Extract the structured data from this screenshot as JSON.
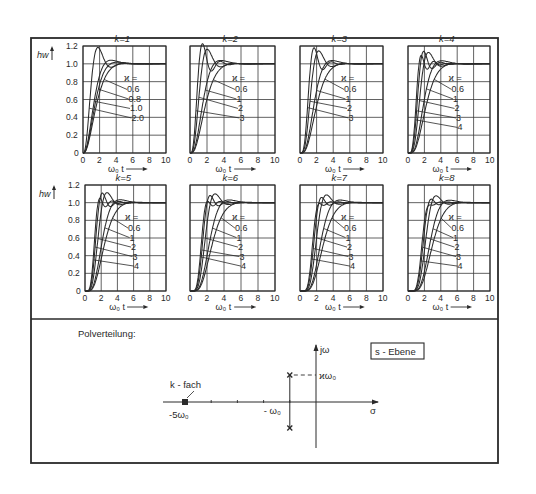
{
  "figure": {
    "frame": {
      "left": 31,
      "top": 38,
      "right": 498,
      "bottom": 463,
      "divider_y": 319
    },
    "colors": {
      "ink": "#2a2a2a",
      "grid": "#3a3a3a",
      "background": "#ffffff"
    },
    "y_axis_label": "h_W",
    "x_axis_label": "ω₀ t",
    "kappa_header": "ϰ ="
  },
  "chart_data": [
    {
      "type": "line",
      "title": "k = 1",
      "k": 1,
      "xlabel": "ω₀ t",
      "ylabel": "h_W",
      "xlim": [
        0,
        10
      ],
      "ylim": [
        0,
        1.2
      ],
      "xticks": [
        "0",
        "2",
        "4",
        "6",
        "8",
        "10"
      ],
      "yticks": [
        "0",
        "0.2",
        "0.4",
        "0.6",
        "0.8",
        "1.0",
        "1.2"
      ],
      "legend_title": "ϰ =",
      "series": [
        {
          "name": "0.6",
          "kappa": 0.6
        },
        {
          "name": "0.8",
          "kappa": 0.8
        },
        {
          "name": "1.0",
          "kappa": 1.0
        },
        {
          "name": "2.0",
          "kappa": 2.0
        }
      ],
      "box": {
        "x0": 83,
        "x1": 166,
        "y0": 46,
        "y1": 153
      },
      "show_yticks": true
    },
    {
      "type": "line",
      "title": "k = 2",
      "k": 2,
      "xlabel": "ω₀ t",
      "ylabel": "h_W",
      "xlim": [
        0,
        10
      ],
      "ylim": [
        0,
        1.2
      ],
      "xticks": [
        "0",
        "2",
        "4",
        "6",
        "8",
        "10"
      ],
      "legend_title": "ϰ =",
      "series": [
        {
          "name": "0.6",
          "kappa": 0.6
        },
        {
          "name": "1",
          "kappa": 1
        },
        {
          "name": "2",
          "kappa": 2
        },
        {
          "name": "3",
          "kappa": 3
        }
      ],
      "box": {
        "x0": 190,
        "x1": 275,
        "y0": 46,
        "y1": 153
      },
      "show_yticks": false
    },
    {
      "type": "line",
      "title": "k = 3",
      "k": 3,
      "xlabel": "ω₀ t",
      "ylabel": "h_W",
      "xlim": [
        0,
        10
      ],
      "ylim": [
        0,
        1.2
      ],
      "xticks": [
        "0",
        "2",
        "4",
        "6",
        "8",
        "10"
      ],
      "legend_title": "ϰ =",
      "series": [
        {
          "name": "0.6",
          "kappa": 0.6
        },
        {
          "name": "1",
          "kappa": 1
        },
        {
          "name": "2",
          "kappa": 2
        },
        {
          "name": "3",
          "kappa": 3
        }
      ],
      "box": {
        "x0": 300,
        "x1": 383,
        "y0": 46,
        "y1": 153
      },
      "show_yticks": false
    },
    {
      "type": "line",
      "title": "k = 4",
      "k": 4,
      "xlabel": "ω₀ t",
      "ylabel": "h_W",
      "xlim": [
        0,
        10
      ],
      "ylim": [
        0,
        1.2
      ],
      "xticks": [
        "0",
        "2",
        "4",
        "6",
        "8",
        "10"
      ],
      "legend_title": "ϰ =",
      "series": [
        {
          "name": "0.6",
          "kappa": 0.6
        },
        {
          "name": "1",
          "kappa": 1
        },
        {
          "name": "2",
          "kappa": 2
        },
        {
          "name": "3",
          "kappa": 3
        },
        {
          "name": "4",
          "kappa": 4
        }
      ],
      "box": {
        "x0": 408,
        "x1": 490,
        "y0": 46,
        "y1": 153
      },
      "show_yticks": false
    },
    {
      "type": "line",
      "title": "k = 5",
      "k": 5,
      "xlabel": "ω₀ t",
      "ylabel": "h_W",
      "xlim": [
        0,
        10
      ],
      "ylim": [
        0,
        1.2
      ],
      "xticks": [
        "0",
        "2",
        "4",
        "6",
        "8",
        "10"
      ],
      "yticks": [
        "0",
        "0.2",
        "0.4",
        "0.6",
        "0.8",
        "1.0",
        "1.2"
      ],
      "legend_title": "ϰ =",
      "series": [
        {
          "name": "0.6",
          "kappa": 0.6
        },
        {
          "name": "1",
          "kappa": 1
        },
        {
          "name": "2",
          "kappa": 2
        },
        {
          "name": "3",
          "kappa": 3
        },
        {
          "name": "4",
          "kappa": 4
        }
      ],
      "box": {
        "x0": 85,
        "x1": 166,
        "y0": 185,
        "y1": 291
      },
      "show_yticks": true
    },
    {
      "type": "line",
      "title": "k = 6",
      "k": 6,
      "xlabel": "ω₀ t",
      "ylabel": "h_W",
      "xlim": [
        0,
        10
      ],
      "ylim": [
        0,
        1.2
      ],
      "xticks": [
        "0",
        "2",
        "4",
        "6",
        "8",
        "10"
      ],
      "legend_title": "ϰ =",
      "series": [
        {
          "name": "0.6",
          "kappa": 0.6
        },
        {
          "name": "1",
          "kappa": 1
        },
        {
          "name": "2",
          "kappa": 2
        },
        {
          "name": "3",
          "kappa": 3
        },
        {
          "name": "4",
          "kappa": 4
        }
      ],
      "box": {
        "x0": 190,
        "x1": 275,
        "y0": 185,
        "y1": 291
      },
      "show_yticks": false
    },
    {
      "type": "line",
      "title": "k = 7",
      "k": 7,
      "xlabel": "ω₀ t",
      "ylabel": "h_W",
      "xlim": [
        0,
        10
      ],
      "ylim": [
        0,
        1.2
      ],
      "xticks": [
        "0",
        "2",
        "4",
        "6",
        "8",
        "10"
      ],
      "legend_title": "ϰ =",
      "series": [
        {
          "name": "0.6",
          "kappa": 0.6
        },
        {
          "name": "1",
          "kappa": 1
        },
        {
          "name": "2",
          "kappa": 2
        },
        {
          "name": "3",
          "kappa": 3
        },
        {
          "name": "4",
          "kappa": 4
        }
      ],
      "box": {
        "x0": 300,
        "x1": 383,
        "y0": 185,
        "y1": 291
      },
      "show_yticks": false
    },
    {
      "type": "line",
      "title": "k = 8",
      "k": 8,
      "xlabel": "ω₀ t",
      "ylabel": "h_W",
      "xlim": [
        0,
        10
      ],
      "ylim": [
        0,
        1.2
      ],
      "xticks": [
        "0",
        "2",
        "4",
        "6",
        "8",
        "10"
      ],
      "legend_title": "ϰ =",
      "series": [
        {
          "name": "0.6",
          "kappa": 0.6
        },
        {
          "name": "1",
          "kappa": 1
        },
        {
          "name": "2",
          "kappa": 2
        },
        {
          "name": "3",
          "kappa": 3
        },
        {
          "name": "4",
          "kappa": 4
        }
      ],
      "box": {
        "x0": 408,
        "x1": 490,
        "y0": 185,
        "y1": 291
      },
      "show_yticks": false
    }
  ],
  "pole_diagram": {
    "title": "Polverteilung:",
    "plane_label": "s - Ebene",
    "imag_axis_label": "jω",
    "real_axis_label": "σ",
    "multi_pole_label": "k - fach",
    "multi_pole_value": "-5ω₀",
    "real_part_label": "- ω₀",
    "imag_part_label": "ϰω₀",
    "origin_x": 316,
    "axis_y": 402,
    "imag_axis_top": 345,
    "imag_axis_bottom": 448,
    "real_axis_left": 163,
    "real_axis_right": 378,
    "unit_px": 26.2,
    "poles": [
      {
        "re": -5,
        "im": 0,
        "mult": "k"
      },
      {
        "re": -1,
        "im": 1
      },
      {
        "re": -1,
        "im": -1
      }
    ]
  }
}
